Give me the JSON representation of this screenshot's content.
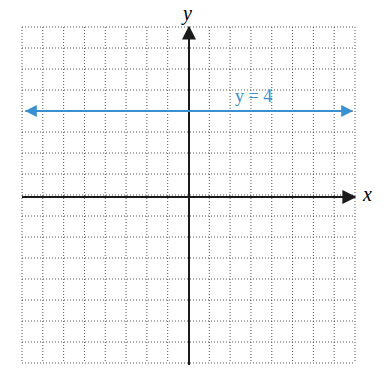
{
  "chart_data": {
    "type": "line",
    "title": "",
    "xlabel": "x",
    "ylabel": "y",
    "xlim": [
      -8,
      8
    ],
    "ylim": [
      -8,
      8
    ],
    "grid": true,
    "grid_style": "dotted",
    "axis_ticks_labeled": false,
    "series": [
      {
        "name": "y = 4",
        "equation": "y = 4",
        "x": [
          -8,
          8
        ],
        "y": [
          4,
          4
        ],
        "color": "#3a8fd0",
        "arrows_both_ends": true
      }
    ],
    "annotations": [
      {
        "text": "y = 4",
        "x": 3,
        "y": 4.3,
        "color": "#3a8fd0"
      }
    ]
  },
  "labels": {
    "x_axis": "x",
    "y_axis": "y",
    "line_label": "y = 4"
  },
  "colors": {
    "line": "#3a8fd0",
    "axes": "#1a1a1a",
    "grid": "#555555"
  }
}
